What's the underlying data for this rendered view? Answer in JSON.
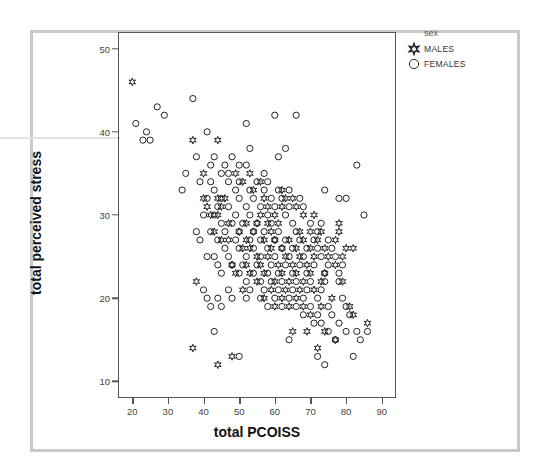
{
  "chart_data": {
    "type": "scatter",
    "title": "",
    "xlabel": "total PCOISS",
    "ylabel": "total perceived stress",
    "xlim": [
      16,
      94
    ],
    "ylim": [
      8,
      52
    ],
    "xticks": [
      20,
      30,
      40,
      50,
      60,
      70,
      80,
      90
    ],
    "yticks": [
      10,
      20,
      30,
      40,
      50
    ],
    "grid": false,
    "legend": {
      "title": "sex",
      "position": "top-right",
      "entries": [
        {
          "label": "MALES",
          "marker": "star-icon",
          "color": "#222222"
        },
        {
          "label": "FEMALES",
          "marker": "circle-icon",
          "color": "#222222"
        }
      ]
    },
    "series": [
      {
        "name": "MALES",
        "marker": "star",
        "points": [
          [
            20,
            46
          ],
          [
            37,
            39
          ],
          [
            44,
            39
          ],
          [
            40,
            35
          ],
          [
            49,
            35
          ],
          [
            53,
            35
          ],
          [
            51,
            34
          ],
          [
            56,
            34
          ],
          [
            54,
            33
          ],
          [
            62,
            33
          ],
          [
            40,
            32
          ],
          [
            44,
            32
          ],
          [
            46,
            32
          ],
          [
            57,
            32
          ],
          [
            63,
            32
          ],
          [
            65,
            32
          ],
          [
            41,
            31
          ],
          [
            45,
            31
          ],
          [
            58,
            31
          ],
          [
            62,
            31
          ],
          [
            66,
            31
          ],
          [
            42,
            30
          ],
          [
            44,
            30
          ],
          [
            56,
            30
          ],
          [
            60,
            30
          ],
          [
            68,
            30
          ],
          [
            71,
            30
          ],
          [
            47,
            29
          ],
          [
            52,
            29
          ],
          [
            55,
            29
          ],
          [
            58,
            29
          ],
          [
            61,
            29
          ],
          [
            78,
            29
          ],
          [
            43,
            28
          ],
          [
            50,
            28
          ],
          [
            54,
            28
          ],
          [
            59,
            28
          ],
          [
            67,
            28
          ],
          [
            70,
            28
          ],
          [
            73,
            28
          ],
          [
            78,
            28
          ],
          [
            45,
            27
          ],
          [
            47,
            27
          ],
          [
            52,
            27
          ],
          [
            57,
            27
          ],
          [
            60,
            27
          ],
          [
            64,
            27
          ],
          [
            68,
            27
          ],
          [
            72,
            27
          ],
          [
            77,
            27
          ],
          [
            51,
            26
          ],
          [
            53,
            26
          ],
          [
            59,
            26
          ],
          [
            62,
            26
          ],
          [
            66,
            26
          ],
          [
            70,
            26
          ],
          [
            74,
            26
          ],
          [
            80,
            26
          ],
          [
            82,
            26
          ],
          [
            55,
            25
          ],
          [
            58,
            25
          ],
          [
            63,
            25
          ],
          [
            67,
            25
          ],
          [
            71,
            25
          ],
          [
            75,
            25
          ],
          [
            79,
            25
          ],
          [
            48,
            24
          ],
          [
            52,
            24
          ],
          [
            56,
            24
          ],
          [
            61,
            24
          ],
          [
            65,
            24
          ],
          [
            69,
            24
          ],
          [
            77,
            24
          ],
          [
            49,
            23
          ],
          [
            53,
            23
          ],
          [
            57,
            23
          ],
          [
            62,
            23
          ],
          [
            66,
            23
          ],
          [
            70,
            23
          ],
          [
            74,
            23
          ],
          [
            38,
            22
          ],
          [
            55,
            22
          ],
          [
            60,
            22
          ],
          [
            64,
            22
          ],
          [
            68,
            22
          ],
          [
            73,
            22
          ],
          [
            79,
            22
          ],
          [
            51,
            21
          ],
          [
            59,
            21
          ],
          [
            63,
            21
          ],
          [
            67,
            21
          ],
          [
            71,
            21
          ],
          [
            57,
            20
          ],
          [
            62,
            20
          ],
          [
            66,
            20
          ],
          [
            76,
            20
          ],
          [
            60,
            19
          ],
          [
            64,
            19
          ],
          [
            68,
            19
          ],
          [
            73,
            19
          ],
          [
            81,
            19
          ],
          [
            70,
            18
          ],
          [
            82,
            18
          ],
          [
            65,
            16
          ],
          [
            69,
            16
          ],
          [
            74,
            16
          ],
          [
            86,
            17
          ],
          [
            77,
            15
          ],
          [
            72,
            14
          ],
          [
            37,
            14
          ],
          [
            48,
            13
          ],
          [
            44,
            12
          ]
        ]
      },
      {
        "name": "FEMALES",
        "marker": "circle",
        "points": [
          [
            21,
            41
          ],
          [
            24,
            40
          ],
          [
            23,
            39
          ],
          [
            25,
            39
          ],
          [
            27,
            43
          ],
          [
            29,
            42
          ],
          [
            37,
            44
          ],
          [
            41,
            40
          ],
          [
            52,
            41
          ],
          [
            60,
            42
          ],
          [
            66,
            42
          ],
          [
            53,
            38
          ],
          [
            63,
            38
          ],
          [
            61,
            37
          ],
          [
            38,
            37
          ],
          [
            43,
            37
          ],
          [
            48,
            37
          ],
          [
            42,
            36
          ],
          [
            46,
            36
          ],
          [
            83,
            36
          ],
          [
            35,
            35
          ],
          [
            45,
            35
          ],
          [
            47,
            35
          ],
          [
            57,
            35
          ],
          [
            50,
            36
          ],
          [
            52,
            36
          ],
          [
            58,
            34
          ],
          [
            39,
            34
          ],
          [
            42,
            34
          ],
          [
            47,
            34
          ],
          [
            50,
            34
          ],
          [
            55,
            34
          ],
          [
            34,
            33
          ],
          [
            43,
            33
          ],
          [
            49,
            33
          ],
          [
            53,
            33
          ],
          [
            57,
            33
          ],
          [
            61,
            33
          ],
          [
            64,
            33
          ],
          [
            74,
            33
          ],
          [
            41,
            32
          ],
          [
            45,
            32
          ],
          [
            50,
            32
          ],
          [
            54,
            32
          ],
          [
            59,
            32
          ],
          [
            62,
            32
          ],
          [
            67,
            32
          ],
          [
            78,
            32
          ],
          [
            80,
            32
          ],
          [
            44,
            31
          ],
          [
            47,
            31
          ],
          [
            52,
            31
          ],
          [
            56,
            31
          ],
          [
            60,
            31
          ],
          [
            64,
            31
          ],
          [
            68,
            31
          ],
          [
            40,
            30
          ],
          [
            43,
            30
          ],
          [
            49,
            30
          ],
          [
            53,
            30
          ],
          [
            58,
            30
          ],
          [
            63,
            30
          ],
          [
            85,
            30
          ],
          [
            45,
            29
          ],
          [
            48,
            29
          ],
          [
            51,
            29
          ],
          [
            55,
            29
          ],
          [
            59,
            29
          ],
          [
            65,
            29
          ],
          [
            70,
            29
          ],
          [
            73,
            29
          ],
          [
            38,
            28
          ],
          [
            42,
            28
          ],
          [
            46,
            28
          ],
          [
            50,
            28
          ],
          [
            54,
            28
          ],
          [
            57,
            28
          ],
          [
            61,
            28
          ],
          [
            66,
            28
          ],
          [
            72,
            28
          ],
          [
            39,
            27
          ],
          [
            44,
            27
          ],
          [
            49,
            27
          ],
          [
            53,
            27
          ],
          [
            56,
            27
          ],
          [
            60,
            27
          ],
          [
            63,
            27
          ],
          [
            67,
            27
          ],
          [
            71,
            27
          ],
          [
            75,
            27
          ],
          [
            46,
            26
          ],
          [
            50,
            26
          ],
          [
            54,
            26
          ],
          [
            58,
            26
          ],
          [
            62,
            26
          ],
          [
            65,
            26
          ],
          [
            69,
            26
          ],
          [
            72,
            26
          ],
          [
            76,
            26
          ],
          [
            41,
            25
          ],
          [
            43,
            25
          ],
          [
            47,
            25
          ],
          [
            52,
            25
          ],
          [
            56,
            25
          ],
          [
            60,
            25
          ],
          [
            64,
            25
          ],
          [
            68,
            25
          ],
          [
            73,
            25
          ],
          [
            77,
            25
          ],
          [
            44,
            24
          ],
          [
            48,
            24
          ],
          [
            51,
            24
          ],
          [
            55,
            24
          ],
          [
            59,
            24
          ],
          [
            63,
            24
          ],
          [
            67,
            24
          ],
          [
            71,
            24
          ],
          [
            75,
            24
          ],
          [
            79,
            24
          ],
          [
            45,
            23
          ],
          [
            50,
            23
          ],
          [
            54,
            23
          ],
          [
            58,
            23
          ],
          [
            61,
            23
          ],
          [
            65,
            23
          ],
          [
            69,
            23
          ],
          [
            74,
            23
          ],
          [
            78,
            23
          ],
          [
            52,
            22
          ],
          [
            56,
            22
          ],
          [
            59,
            22
          ],
          [
            62,
            22
          ],
          [
            66,
            22
          ],
          [
            70,
            22
          ],
          [
            74,
            22
          ],
          [
            78,
            22
          ],
          [
            40,
            21
          ],
          [
            47,
            21
          ],
          [
            53,
            21
          ],
          [
            57,
            21
          ],
          [
            61,
            21
          ],
          [
            65,
            21
          ],
          [
            69,
            21
          ],
          [
            73,
            21
          ],
          [
            41,
            20
          ],
          [
            44,
            20
          ],
          [
            48,
            20
          ],
          [
            52,
            20
          ],
          [
            56,
            20
          ],
          [
            60,
            20
          ],
          [
            64,
            20
          ],
          [
            68,
            20
          ],
          [
            72,
            20
          ],
          [
            79,
            20
          ],
          [
            42,
            19
          ],
          [
            45,
            19
          ],
          [
            58,
            19
          ],
          [
            62,
            19
          ],
          [
            66,
            19
          ],
          [
            70,
            19
          ],
          [
            75,
            19
          ],
          [
            80,
            19
          ],
          [
            68,
            18
          ],
          [
            72,
            18
          ],
          [
            76,
            18
          ],
          [
            81,
            18
          ],
          [
            71,
            17
          ],
          [
            73,
            17
          ],
          [
            78,
            17
          ],
          [
            43,
            16
          ],
          [
            75,
            16
          ],
          [
            80,
            16
          ],
          [
            83,
            16
          ],
          [
            86,
            16
          ],
          [
            64,
            15
          ],
          [
            77,
            15
          ],
          [
            84,
            15
          ],
          [
            74,
            12
          ],
          [
            72,
            13
          ],
          [
            82,
            13
          ],
          [
            50,
            13
          ]
        ]
      }
    ]
  },
  "figure": {
    "canvas_bg": "#ffffff",
    "frame_color": "#c9c9c9",
    "axis_color": "#555555",
    "marker_color": "#222222"
  }
}
